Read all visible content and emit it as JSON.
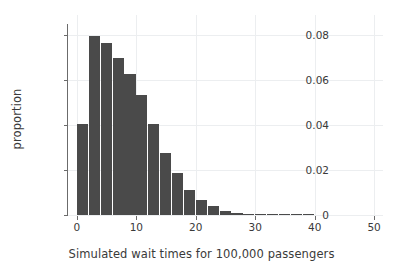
{
  "chart_data": {
    "type": "bar",
    "title": "",
    "subtitle": "",
    "xlabel": "Simulated wait times for 100,000 passengers",
    "ylabel": "proportion",
    "xlim": [
      -1.5,
      51.5
    ],
    "ylim": [
      0,
      0.085
    ],
    "xticks": [
      0,
      10,
      20,
      30,
      40,
      50
    ],
    "xtick_labels": [
      "0",
      "10",
      "20",
      "30",
      "40",
      "50"
    ],
    "yticks": [
      0,
      0.02,
      0.04,
      0.06,
      0.08
    ],
    "ytick_labels": [
      "0",
      "0.02",
      "0.04",
      "0.06",
      "0.08"
    ],
    "grid": true,
    "grid_axis": "both",
    "legend": "none",
    "bar_color": "#4a4a4a",
    "grid_color": "#eceef0",
    "axis_color": "#6b6b6b",
    "background": "#ffffff",
    "bin_width": 2,
    "bin_edges": [
      0,
      2,
      4,
      6,
      8,
      10,
      12,
      14,
      16,
      18,
      20,
      22,
      24,
      26,
      28,
      30,
      32,
      34,
      36,
      38,
      40
    ],
    "categories": [
      "0-2",
      "2-4",
      "4-6",
      "6-8",
      "8-10",
      "10-12",
      "12-14",
      "14-16",
      "16-18",
      "18-20",
      "20-22",
      "22-24",
      "24-26",
      "26-28",
      "28-30",
      "30-32",
      "32-34",
      "34-36",
      "36-38",
      "38-40"
    ],
    "bin_starts": [
      0,
      2,
      4,
      6,
      8,
      10,
      12,
      14,
      16,
      18,
      20,
      22,
      24,
      26,
      28,
      30,
      32,
      34,
      36,
      38
    ],
    "values": [
      0.0406,
      0.0797,
      0.0766,
      0.0697,
      0.0628,
      0.0532,
      0.0403,
      0.0277,
      0.0187,
      0.0112,
      0.0065,
      0.0038,
      0.0018,
      0.0009,
      0.0004,
      0.0002,
      0.0001,
      5e-05,
      2e-05,
      1e-05
    ]
  }
}
